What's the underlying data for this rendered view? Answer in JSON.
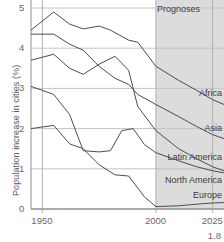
{
  "chart_data": {
    "type": "line",
    "title": "",
    "xlabel": "",
    "ylabel": "Population increase in cities (%)",
    "xlim": [
      1945,
      2030
    ],
    "ylim": [
      0,
      5
    ],
    "xticks": [
      1950,
      2000,
      2025
    ],
    "xticklabels": [
      "1950",
      "2000",
      "2025"
    ],
    "yticks": [
      0,
      1,
      2,
      3,
      4,
      5
    ],
    "yticklabels": [
      "0",
      "1",
      "2",
      "3",
      "4",
      "5"
    ],
    "grid": true,
    "legend_position": "inline-right",
    "annotations": [
      {
        "text": "Prognoses",
        "x": 2002,
        "y": 4.85
      },
      {
        "text": "1.8",
        "x": 2029,
        "y": -0.75
      }
    ],
    "shaded_region": {
      "label": "Prognoses",
      "x_start": 2000,
      "x_end": 2030,
      "color": "#dcdcdc"
    },
    "series": [
      {
        "name": "Africa",
        "label": "Africa",
        "color": "#4d4d4d",
        "x": [
          1945,
          1955,
          1962,
          1968,
          1975,
          1980,
          1988,
          1992,
          2000,
          2010,
          2018,
          2025,
          2030
        ],
        "values": [
          4.45,
          4.9,
          4.6,
          4.48,
          4.55,
          4.45,
          4.2,
          4.15,
          3.55,
          3.2,
          2.95,
          2.72,
          2.6
        ]
      },
      {
        "name": "Asia",
        "label": "Asia",
        "color": "#4d4d4d",
        "x": [
          1945,
          1955,
          1962,
          1968,
          1975,
          1982,
          1988,
          1992,
          2000,
          2010,
          2018,
          2025,
          2030
        ],
        "values": [
          4.35,
          4.35,
          4.1,
          3.95,
          3.55,
          3.25,
          3.1,
          2.85,
          2.6,
          2.3,
          2.05,
          1.85,
          1.75
        ]
      },
      {
        "name": "Latin America",
        "label": "Latin America",
        "color": "#4d4d4d",
        "x": [
          1945,
          1955,
          1962,
          1968,
          1975,
          1982,
          1988,
          1992,
          2000,
          2010,
          2018,
          2025,
          2030
        ],
        "values": [
          3.7,
          3.85,
          3.5,
          3.35,
          3.6,
          3.8,
          3.45,
          2.55,
          1.95,
          1.5,
          1.25,
          1.05,
          0.95
        ]
      },
      {
        "name": "North America",
        "label": "North America",
        "color": "#4d4d4d",
        "x": [
          1945,
          1955,
          1962,
          1968,
          1975,
          1980,
          1985,
          1990,
          1995,
          2000,
          2010,
          2018,
          2025,
          2030
        ],
        "values": [
          3.05,
          2.85,
          2.35,
          1.45,
          1.42,
          1.45,
          1.95,
          2.0,
          1.6,
          1.4,
          1.2,
          1.05,
          0.95,
          0.9
        ]
      },
      {
        "name": "Europe",
        "label": "Europe",
        "color": "#4d4d4d",
        "x": [
          1945,
          1955,
          1962,
          1968,
          1975,
          1982,
          1988,
          1995,
          2000,
          2010,
          2018,
          2025,
          2030
        ],
        "values": [
          2.0,
          2.08,
          1.62,
          1.5,
          1.1,
          0.85,
          0.82,
          0.3,
          0.06,
          0.08,
          0.12,
          0.15,
          0.16
        ]
      }
    ]
  },
  "axis": {
    "y_title": "Population increase in cities (%)"
  },
  "figure": {
    "number": "1.8"
  }
}
